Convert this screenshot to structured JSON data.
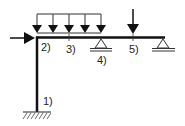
{
  "diagram": {
    "type": "structural-frame",
    "colors": {
      "member": "#111111",
      "load": "#111111",
      "support": "#333333",
      "label": "#222222"
    },
    "nodes": [
      {
        "id": "1",
        "label": "1)",
        "description": "fixed base of column"
      },
      {
        "id": "2",
        "label": "2)",
        "description": "frame corner (column-beam joint)"
      },
      {
        "id": "3",
        "label": "3)",
        "description": "point on beam under distributed load"
      },
      {
        "id": "4",
        "label": "4)",
        "description": "pin/roller support"
      },
      {
        "id": "5",
        "label": "5)",
        "description": "point load location"
      }
    ],
    "members": [
      {
        "name": "column",
        "from": "1",
        "to": "2"
      },
      {
        "name": "beam",
        "from": "2",
        "to": "right-support"
      }
    ],
    "supports": [
      {
        "name": "fixed-support",
        "at": "1",
        "kind": "fixed"
      },
      {
        "name": "pin-support-4",
        "at": "4",
        "kind": "pin"
      },
      {
        "name": "pin-support-right",
        "at": "right-end",
        "kind": "pin"
      }
    ],
    "loads": [
      {
        "name": "horizontal-point-load",
        "at": "2",
        "direction": "right"
      },
      {
        "name": "distributed-load",
        "from": "2",
        "to": "4",
        "direction": "down",
        "arrow_count": 5
      },
      {
        "name": "vertical-point-load",
        "at": "5",
        "direction": "down"
      }
    ],
    "labels": {
      "n1": "1)",
      "n2": "2)",
      "n3": "3)",
      "n4": "4)",
      "n5": "5)"
    }
  }
}
